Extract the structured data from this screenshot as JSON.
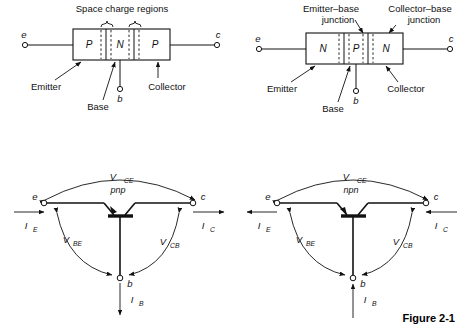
{
  "figure": {
    "caption": "Figure 2-1"
  },
  "panels": {
    "pnp_structure": {
      "title": "Space charge regions",
      "regions": [
        "P",
        "N",
        "P"
      ],
      "labels": {
        "emitter": "Emitter",
        "base": "Base",
        "collector": "Collector"
      },
      "terminals": {
        "emitter": "e",
        "collector": "c",
        "base": "b"
      }
    },
    "npn_structure": {
      "junction_labels": {
        "emitter_base_line1": "Emitter–base",
        "emitter_base_line2": "junction",
        "collector_base_line1": "Collector–base",
        "collector_base_line2": "junction"
      },
      "regions": [
        "N",
        "P",
        "N"
      ],
      "labels": {
        "emitter": "Emitter",
        "base": "Base",
        "collector": "Collector"
      },
      "terminals": {
        "emitter": "e",
        "collector": "c",
        "base": "b"
      }
    },
    "pnp_symbol": {
      "device_type": "pnp",
      "terminals": {
        "emitter": "e",
        "collector": "c",
        "base": "b"
      },
      "voltages": {
        "vce_main": "V",
        "vce_sub": "CE",
        "vbe_main": "V",
        "vbe_sub": "BE",
        "vcb_main": "V",
        "vcb_sub": "CB"
      },
      "currents": {
        "ie_main": "I",
        "ie_sub": "E",
        "ic_main": "I",
        "ic_sub": "C",
        "ib_main": "I",
        "ib_sub": "B"
      }
    },
    "npn_symbol": {
      "device_type": "npn",
      "terminals": {
        "emitter": "e",
        "collector": "c",
        "base": "b"
      },
      "voltages": {
        "vce_main": "V",
        "vce_sub": "CE",
        "vbe_main": "V",
        "vbe_sub": "BE",
        "vcb_main": "V",
        "vcb_sub": "CB"
      },
      "currents": {
        "ie_main": "I",
        "ie_sub": "E",
        "ic_main": "I",
        "ic_sub": "C",
        "ib_main": "I",
        "ib_sub": "B"
      }
    }
  }
}
